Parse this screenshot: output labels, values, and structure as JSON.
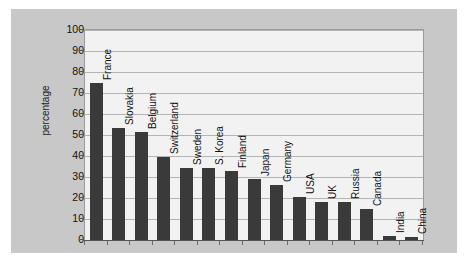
{
  "chart_data": {
    "type": "bar",
    "title": "",
    "xlabel": "",
    "ylabel": "percentage",
    "ylim": [
      0,
      100
    ],
    "ytick_labels": [
      "0",
      "10",
      "20",
      "30",
      "40",
      "50",
      "60",
      "70",
      "80",
      "90",
      "100"
    ],
    "ytick_values": [
      0,
      10,
      20,
      30,
      40,
      50,
      60,
      70,
      80,
      90,
      100
    ],
    "grid": true,
    "legend": "none",
    "bar_color": "#3a3a3a",
    "plot_background": "#f2f2f2",
    "panel_background": "#c8c8c8",
    "categories": [
      "France",
      "Slovakia",
      "Belgium",
      "Switzerland",
      "Sweden",
      "S. Korea",
      "Finland",
      "Japan",
      "Germany",
      "USA",
      "UK",
      "Russia",
      "Canada",
      "India",
      "China"
    ],
    "values": [
      75,
      53.5,
      51.5,
      39.5,
      34.5,
      34.5,
      33,
      29,
      26,
      20.5,
      18,
      18,
      15,
      2,
      1.5
    ]
  }
}
